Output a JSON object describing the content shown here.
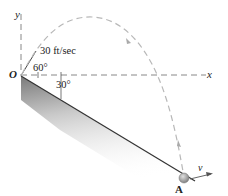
{
  "diagram": {
    "type": "projectile on incline",
    "labels": {
      "y_axis": "y",
      "x_axis": "x",
      "origin": "O",
      "speed": "30 ft/sec",
      "launch_angle": "60°",
      "incline_angle": "30°",
      "point": "A",
      "velocity": "v"
    },
    "colors": {
      "trajectory": "#b8b8b8",
      "axes": "#888888",
      "incline_edge": "#333333",
      "ball": "#9a9a9a"
    }
  }
}
